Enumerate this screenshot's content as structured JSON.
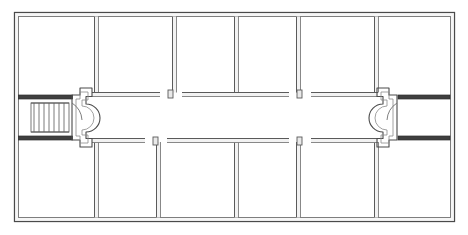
{
  "drawing": {
    "title": "Building Floor Plan",
    "type": "architectural-floor-plan",
    "width": 468,
    "height": 235,
    "background_color": "#ffffff",
    "line_color": "#3a3a3a",
    "wall_fill_color": "#f2f2f2",
    "wall_dark_color": "#4a4a4a",
    "stair_line_color": "#6b6b6b"
  },
  "envelope": {
    "name": "outer-wall",
    "x": 14,
    "y": 12,
    "width": 441,
    "height": 210,
    "wall_thickness": 5
  },
  "corridor": {
    "name": "central-corridor",
    "y_top": 96,
    "y_bottom": 139,
    "x_left": 80,
    "x_right": 389,
    "column_count": 8,
    "column_radius": 4,
    "column_y": 121,
    "column_x_positions": [
      114,
      152,
      190,
      228,
      266,
      304,
      331,
      359
    ]
  },
  "upper_rooms": [
    {
      "label": "Room U1",
      "x": 19,
      "y": 17,
      "width": 75,
      "height": 75
    },
    {
      "label": "Room U2",
      "x": 97,
      "y": 17,
      "width": 75,
      "height": 75
    },
    {
      "label": "Room U3",
      "x": 175,
      "y": 17,
      "width": 59,
      "height": 75
    },
    {
      "label": "Room U4",
      "x": 237,
      "y": 17,
      "width": 59,
      "height": 75
    },
    {
      "label": "Room U5",
      "x": 299,
      "y": 17,
      "width": 75,
      "height": 75
    },
    {
      "label": "Room U6",
      "x": 377,
      "y": 17,
      "width": 73,
      "height": 75
    }
  ],
  "lower_rooms": [
    {
      "label": "Room L1",
      "x": 19,
      "y": 146,
      "width": 75,
      "height": 71
    },
    {
      "label": "Room L2",
      "x": 97,
      "y": 146,
      "width": 59,
      "height": 71
    },
    {
      "label": "Room L3",
      "x": 159,
      "y": 146,
      "width": 75,
      "height": 71
    },
    {
      "label": "Room L4",
      "x": 237,
      "y": 146,
      "width": 59,
      "height": 71
    },
    {
      "label": "Room L5",
      "x": 299,
      "y": 146,
      "width": 75,
      "height": 71
    },
    {
      "label": "Room L6",
      "x": 377,
      "y": 146,
      "width": 73,
      "height": 71
    }
  ],
  "stairs": [
    {
      "label": "Left Stair",
      "name": "stair-left",
      "x": 19,
      "y": 99,
      "width": 53,
      "height": 37,
      "tread_count": 7,
      "landing_side": "right",
      "divider": false
    },
    {
      "label": "Right Stair",
      "name": "stair-right",
      "x": 400,
      "y": 99,
      "width": 53,
      "height": 37,
      "tread_count": 7,
      "landing_side": "left",
      "divider": true
    }
  ],
  "doors": [
    {
      "name": "door-upper-left-vestibule",
      "cx": 87,
      "cy": 98,
      "radius": 5,
      "side": "upper"
    },
    {
      "name": "door-lower-left-vestibule",
      "cx": 87,
      "cy": 137,
      "radius": 5,
      "side": "lower"
    },
    {
      "name": "door-upper-pair-1a",
      "cx": 163,
      "cy": 98,
      "radius": 5,
      "side": "upper"
    },
    {
      "name": "door-upper-pair-1b",
      "cx": 178,
      "cy": 98,
      "radius": 5,
      "side": "upper"
    },
    {
      "name": "door-upper-pair-2a",
      "cx": 292,
      "cy": 98,
      "radius": 5,
      "side": "upper"
    },
    {
      "name": "door-upper-pair-2b",
      "cx": 307,
      "cy": 98,
      "radius": 5,
      "side": "upper"
    },
    {
      "name": "door-lower-pair-1a",
      "cx": 148,
      "cy": 137,
      "radius": 5,
      "side": "lower"
    },
    {
      "name": "door-lower-pair-1b",
      "cx": 163,
      "cy": 137,
      "radius": 5,
      "side": "lower"
    },
    {
      "name": "door-lower-pair-2a",
      "cx": 292,
      "cy": 137,
      "radius": 5,
      "side": "lower"
    },
    {
      "name": "door-lower-pair-2b",
      "cx": 307,
      "cy": 137,
      "radius": 5,
      "side": "lower"
    },
    {
      "name": "door-upper-right-vestibule",
      "cx": 382,
      "cy": 98,
      "radius": 5,
      "side": "upper"
    },
    {
      "name": "door-lower-right-vestibule",
      "cx": 382,
      "cy": 137,
      "radius": 5,
      "side": "lower"
    }
  ],
  "vestibules": [
    {
      "name": "vestibule-left",
      "x": 72,
      "y": 96,
      "width": 16,
      "height": 43
    },
    {
      "name": "vestibule-right",
      "x": 381,
      "y": 96,
      "width": 16,
      "height": 43
    }
  ]
}
